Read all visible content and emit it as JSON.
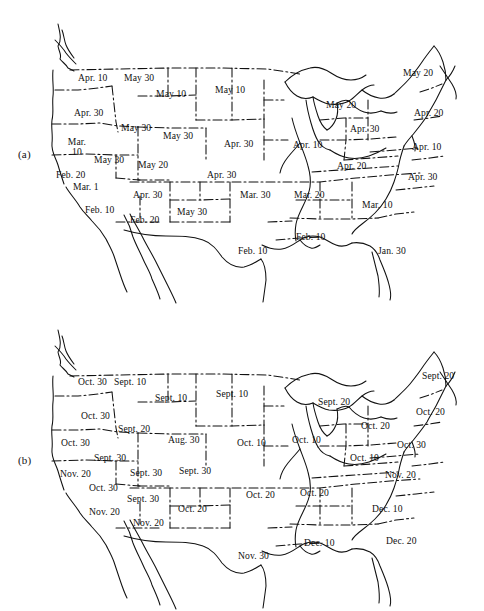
{
  "figure": {
    "background_color": "#ffffff",
    "ink_color": "#111111"
  },
  "panels": [
    {
      "id": "a",
      "label": "(a)",
      "caption": "Average date of last killing frost in spring",
      "labels": [
        {
          "text": "Apr. 10",
          "x": 78,
          "y": 73
        },
        {
          "text": "May 30",
          "x": 124,
          "y": 73
        },
        {
          "text": "May 10",
          "x": 156,
          "y": 89
        },
        {
          "text": "May 10",
          "x": 215,
          "y": 85
        },
        {
          "text": "May 20",
          "x": 403,
          "y": 68
        },
        {
          "text": "May 20",
          "x": 326,
          "y": 100
        },
        {
          "text": "Apr. 20",
          "x": 414,
          "y": 108
        },
        {
          "text": "Apr. 30",
          "x": 74,
          "y": 108
        },
        {
          "text": "May 30",
          "x": 121,
          "y": 123
        },
        {
          "text": "May 30",
          "x": 163,
          "y": 131
        },
        {
          "text": "Apr. 30",
          "x": 350,
          "y": 124
        },
        {
          "text": "Apr. 30",
          "x": 224,
          "y": 139
        },
        {
          "text": "Apr. 10",
          "x": 293,
          "y": 140
        },
        {
          "text": "Apr. 10",
          "x": 412,
          "y": 142
        },
        {
          "text": "Mar. 10",
          "x": 64,
          "y": 137,
          "two_line": true
        },
        {
          "text": "May 30",
          "x": 94,
          "y": 155
        },
        {
          "text": "May 20",
          "x": 138,
          "y": 160
        },
        {
          "text": "Apr. 30",
          "x": 207,
          "y": 170
        },
        {
          "text": "Apr. 20",
          "x": 337,
          "y": 161
        },
        {
          "text": "Apr. 30",
          "x": 408,
          "y": 172
        },
        {
          "text": "Feb. 20",
          "x": 56,
          "y": 170
        },
        {
          "text": "Mar. 1",
          "x": 73,
          "y": 182
        },
        {
          "text": "Apr. 30",
          "x": 133,
          "y": 190
        },
        {
          "text": "Mar. 30",
          "x": 240,
          "y": 190
        },
        {
          "text": "Mar. 20",
          "x": 294,
          "y": 190
        },
        {
          "text": "Feb. 10",
          "x": 85,
          "y": 205
        },
        {
          "text": "Mar. 10",
          "x": 362,
          "y": 200
        },
        {
          "text": "Feb. 20",
          "x": 130,
          "y": 215
        },
        {
          "text": "May 30",
          "x": 177,
          "y": 207
        },
        {
          "text": "Feb. 10",
          "x": 296,
          "y": 232
        },
        {
          "text": "Feb. 10",
          "x": 238,
          "y": 246
        },
        {
          "text": "Jan. 30",
          "x": 378,
          "y": 246
        }
      ]
    },
    {
      "id": "b",
      "label": "(b)",
      "caption": "Average date of first killing frost in fall",
      "labels": [
        {
          "text": "Oct. 30",
          "x": 78,
          "y": 377
        },
        {
          "text": "Sept. 10",
          "x": 114,
          "y": 377
        },
        {
          "text": "Sept. 10",
          "x": 155,
          "y": 393
        },
        {
          "text": "Sept. 10",
          "x": 216,
          "y": 389
        },
        {
          "text": "Sept. 20",
          "x": 422,
          "y": 371
        },
        {
          "text": "Sept. 20",
          "x": 318,
          "y": 397
        },
        {
          "text": "Oct. 30",
          "x": 81,
          "y": 411
        },
        {
          "text": "Oct. 20",
          "x": 416,
          "y": 407
        },
        {
          "text": "Sept. 20",
          "x": 118,
          "y": 424
        },
        {
          "text": "Aug. 30",
          "x": 168,
          "y": 435
        },
        {
          "text": "Oct. 10",
          "x": 237,
          "y": 438
        },
        {
          "text": "Oct. 10",
          "x": 292,
          "y": 435
        },
        {
          "text": "Oct. 20",
          "x": 361,
          "y": 421
        },
        {
          "text": "Oct. 30",
          "x": 61,
          "y": 438
        },
        {
          "text": "Oct. 30",
          "x": 397,
          "y": 440
        },
        {
          "text": "Sept. 30",
          "x": 94,
          "y": 453
        },
        {
          "text": "Oct. 10",
          "x": 350,
          "y": 453
        },
        {
          "text": "Sept. 30",
          "x": 130,
          "y": 468
        },
        {
          "text": "Sept. 30",
          "x": 179,
          "y": 466
        },
        {
          "text": "Nov. 20",
          "x": 60,
          "y": 469
        },
        {
          "text": "Nov. 20",
          "x": 385,
          "y": 470
        },
        {
          "text": "Oct. 30",
          "x": 89,
          "y": 483
        },
        {
          "text": "Sept. 30",
          "x": 127,
          "y": 494
        },
        {
          "text": "Oct. 20",
          "x": 246,
          "y": 490
        },
        {
          "text": "Oct. 20",
          "x": 300,
          "y": 488
        },
        {
          "text": "Oct. 20",
          "x": 178,
          "y": 504
        },
        {
          "text": "Nov. 20",
          "x": 89,
          "y": 507
        },
        {
          "text": "Dec. 10",
          "x": 372,
          "y": 504
        },
        {
          "text": "Nov. 20",
          "x": 133,
          "y": 518
        },
        {
          "text": "Dec. 10",
          "x": 304,
          "y": 538
        },
        {
          "text": "Dec. 20",
          "x": 386,
          "y": 536
        },
        {
          "text": "Nov. 30",
          "x": 238,
          "y": 551
        }
      ]
    }
  ]
}
